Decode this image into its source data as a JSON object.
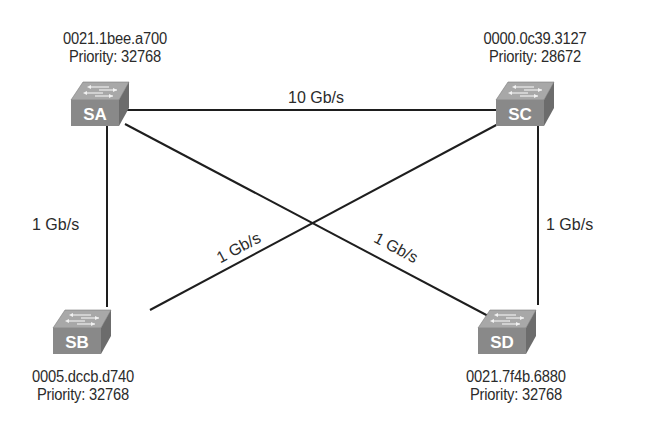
{
  "diagram": {
    "type": "spanning-tree-topology",
    "switches": [
      {
        "id": "SA",
        "label": "SA",
        "mac": "0021.1bee.a700",
        "priority_text": "Priority: 32768",
        "priority": 32768
      },
      {
        "id": "SB",
        "label": "SB",
        "mac": "0005.dccb.d740",
        "priority_text": "Priority: 32768",
        "priority": 32768
      },
      {
        "id": "SC",
        "label": "SC",
        "mac": "0000.0c39.3127",
        "priority_text": "Priority: 28672",
        "priority": 28672
      },
      {
        "id": "SD",
        "label": "SD",
        "mac": "0021.7f4b.6880",
        "priority_text": "Priority: 32768",
        "priority": 32768
      }
    ],
    "links": [
      {
        "from": "SA",
        "to": "SC",
        "speed": "10 Gb/s"
      },
      {
        "from": "SA",
        "to": "SB",
        "speed": "1 Gb/s"
      },
      {
        "from": "SC",
        "to": "SB",
        "speed": "1 Gb/s"
      },
      {
        "from": "SA",
        "to": "SD",
        "speed": "1 Gb/s"
      },
      {
        "from": "SC",
        "to": "SD",
        "speed": "1 Gb/s"
      }
    ],
    "colors": {
      "switch_front": "#8a8a8a",
      "switch_top": "#a9a9a9",
      "switch_side": "#6e6e6e",
      "link": "#1e1e1e",
      "text": "#2b2b2b"
    }
  }
}
